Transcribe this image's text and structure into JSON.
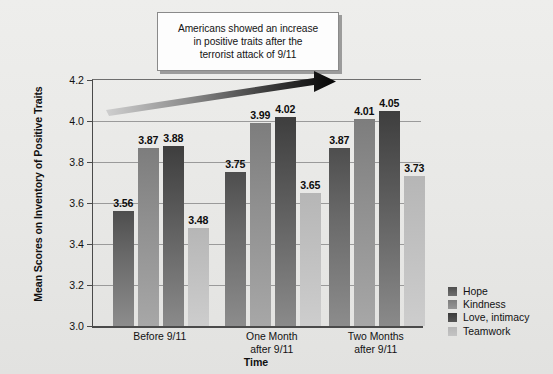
{
  "callout": {
    "text": "Americans showed an increase\nin positive traits after the\nterrorist attack of 9/11"
  },
  "chart_data": {
    "type": "bar",
    "title": "",
    "annotation": "Americans showed an increase in positive traits after the terrorist attack of 9/11",
    "xlabel": "Time",
    "ylabel": "Mean Scores on Inventory of Positive Traits",
    "categories": [
      "Before 9/11",
      "One Month\nafter 9/11",
      "Two Months\nafter 9/11"
    ],
    "series": [
      {
        "name": "Hope",
        "color": "#5e5e5e",
        "values": [
          3.56,
          3.75,
          3.87
        ]
      },
      {
        "name": "Kindness",
        "color": "#8f8f8f",
        "values": [
          3.87,
          3.99,
          4.01
        ]
      },
      {
        "name": "Love, intimacy",
        "color": "#4a4a4a",
        "values": [
          3.88,
          4.02,
          4.05
        ]
      },
      {
        "name": "Teamwork",
        "color": "#bfbfbf",
        "values": [
          3.48,
          3.65,
          3.73
        ]
      }
    ],
    "ylim": [
      3.0,
      4.2
    ],
    "yticks": [
      "3.0",
      "3.2",
      "3.4",
      "3.6",
      "3.8",
      "4.0",
      "4.2"
    ],
    "grid": true,
    "legend_position": "right-bottom",
    "trend_arrow": {
      "label": "upward-trend-arrow",
      "direction": "up-right",
      "color_start": "#c8c8c8",
      "color_end": "#080808"
    }
  },
  "legend": {
    "items": [
      {
        "label": "Hope"
      },
      {
        "label": "Kindness"
      },
      {
        "label": "Love, intimacy"
      },
      {
        "label": "Teamwork"
      }
    ]
  }
}
